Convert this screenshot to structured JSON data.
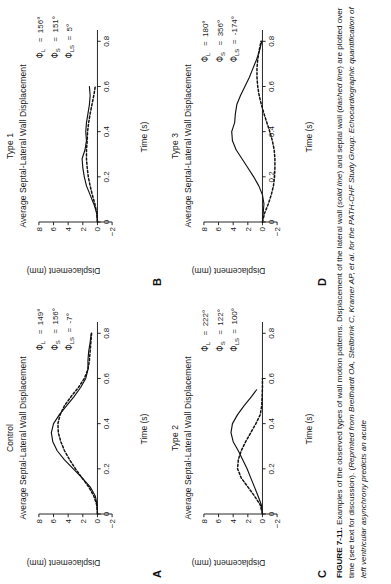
{
  "figure": {
    "number": "FIGURE 7-11.",
    "caption_plain": "FIGURE 7-11. Examples of the observed types of wall motion patterns. Displacement of the lateral wall (solid line) and septal wall (dashed line) are plotted over time (see text for discussion). (Reprinted from Breithardt OA, Stellbrink C, Kramer AP, et al. for the PATH-CHF Study Group: Echocardiographic quantification of left ventricular asynchrony predicts an acute",
    "caption_segments": [
      {
        "text": "FIGURE 7-11.",
        "style": "bold"
      },
      {
        "text": " Examples of the observed types of wall motion patterns. Displacement of the lateral wall (",
        "style": "normal"
      },
      {
        "text": "solid line",
        "style": "italic"
      },
      {
        "text": ") and septal wall (",
        "style": "normal"
      },
      {
        "text": "dashed line",
        "style": "italic"
      },
      {
        "text": ") are plotted over time (see text for discussion). (",
        "style": "normal"
      },
      {
        "text": "Reprinted from Breithardt OA, Stellbrink C, Kramer AP, et al. for the PATH-CHF Study Group: Echocardiographic quantification of left ventricular asynchrony predicts an acute",
        "style": "italic"
      }
    ]
  },
  "legend": {
    "solid_line": "lateral wall",
    "dashed_line": "septal wall"
  },
  "axes": {
    "xlabel": "Time (s)",
    "ylabel": "Displacement (mm)",
    "xticks": [
      "0",
      "0.2",
      "0.4",
      "0.6",
      "0.8"
    ],
    "yticks": [
      "8",
      "6",
      "4",
      "2",
      "0",
      "-2"
    ],
    "xlim": [
      0,
      0.85
    ],
    "ylim": [
      -2.6,
      8.6
    ]
  },
  "panels": [
    {
      "letter": "A",
      "group": "Control",
      "title": "Average Septal-Lateral Wall Displacement",
      "annotations": [
        {
          "symbol": "Φ",
          "sub": "L",
          "value": "149°"
        },
        {
          "symbol": "Φ",
          "sub": "S",
          "value": "156°"
        },
        {
          "symbol": "Φ",
          "sub": "LS",
          "value": "-7°"
        }
      ]
    },
    {
      "letter": "B",
      "group": "Type 1",
      "title": "Average Septal-Lateral Wall Displacement",
      "annotations": [
        {
          "symbol": "Φ",
          "sub": "L",
          "value": "156°"
        },
        {
          "symbol": "Φ",
          "sub": "S",
          "value": "151°"
        },
        {
          "symbol": "Φ",
          "sub": "LS",
          "value": "5°"
        }
      ]
    },
    {
      "letter": "C",
      "group": "Type 2",
      "title": "Average Septal-Lateral Wall Displacement",
      "annotations": [
        {
          "symbol": "Φ",
          "sub": "L",
          "value": "222°"
        },
        {
          "symbol": "Φ",
          "sub": "S",
          "value": "122°"
        },
        {
          "symbol": "Φ",
          "sub": "LS",
          "value": "100°"
        }
      ]
    },
    {
      "letter": "D",
      "group": "Type 3",
      "title": "Average Septal-Lateral Wall Displacement",
      "annotations": [
        {
          "symbol": "Φ",
          "sub": "L",
          "value": "180°"
        },
        {
          "symbol": "Φ",
          "sub": "S",
          "value": "356°"
        },
        {
          "symbol": "Φ",
          "sub": "LS",
          "value": "-174°"
        }
      ]
    }
  ],
  "chart_data": [
    {
      "type": "line",
      "panel": "A",
      "title": "Control",
      "subtitle": "Average Septal-Lateral Wall Displacement",
      "xlabel": "Time (s)",
      "ylabel": "Displacement (mm)",
      "xlim": [
        0,
        0.85
      ],
      "ylim": [
        -2.6,
        8.6
      ],
      "xticks": [
        0,
        0.2,
        0.4,
        0.6,
        0.8
      ],
      "yticks": [
        -2,
        0,
        2,
        4,
        6,
        8
      ],
      "grid": false,
      "legend": "none",
      "series": [
        {
          "name": "lateral wall (solid line)",
          "style": "solid",
          "x": [
            0,
            0.04,
            0.08,
            0.12,
            0.16,
            0.2,
            0.24,
            0.28,
            0.32,
            0.36,
            0.4,
            0.44,
            0.48,
            0.52,
            0.56,
            0.6,
            0.64,
            0.68,
            0.72,
            0.76,
            0.8
          ],
          "y": [
            0.0,
            0.05,
            0.3,
            1.0,
            2.1,
            3.3,
            4.5,
            5.5,
            6.1,
            6.3,
            6.0,
            5.2,
            4.2,
            3.2,
            2.3,
            1.6,
            1.3,
            1.3,
            1.2,
            1.0,
            0.85
          ]
        },
        {
          "name": "septal wall (dashed line)",
          "style": "dashed",
          "x": [
            0,
            0.04,
            0.08,
            0.12,
            0.16,
            0.2,
            0.24,
            0.28,
            0.32,
            0.36,
            0.4,
            0.44,
            0.48,
            0.52,
            0.56,
            0.6,
            0.64,
            0.68,
            0.72,
            0.76,
            0.8
          ],
          "y": [
            0.0,
            0.1,
            0.5,
            1.2,
            2.1,
            3.0,
            3.8,
            4.5,
            5.0,
            5.35,
            5.4,
            5.1,
            4.5,
            3.6,
            2.6,
            1.8,
            1.3,
            1.1,
            1.0,
            0.9,
            0.8
          ]
        }
      ]
    },
    {
      "type": "line",
      "panel": "B",
      "title": "Type 1",
      "subtitle": "Average Septal-Lateral Wall Displacement",
      "xlabel": "Time (s)",
      "ylabel": "Displacement (mm)",
      "xlim": [
        0,
        0.85
      ],
      "ylim": [
        -2.6,
        8.6
      ],
      "xticks": [
        0,
        0.2,
        0.4,
        0.6,
        0.8
      ],
      "yticks": [
        -2,
        0,
        2,
        4,
        6,
        8
      ],
      "grid": false,
      "legend": "none",
      "series": [
        {
          "name": "lateral wall (solid line)",
          "style": "solid",
          "x": [
            0,
            0.04,
            0.08,
            0.12,
            0.16,
            0.2,
            0.24,
            0.28,
            0.32,
            0.36,
            0.4,
            0.44,
            0.48,
            0.52,
            0.56,
            0.6
          ],
          "y": [
            0.0,
            0.1,
            0.5,
            1.0,
            1.5,
            1.8,
            2.0,
            2.1,
            1.7,
            1.5,
            1.6,
            1.5,
            1.3,
            1.1,
            1.0,
            1.1
          ]
        },
        {
          "name": "septal wall (dashed line)",
          "style": "dashed",
          "x": [
            0,
            0.04,
            0.08,
            0.12,
            0.16,
            0.2,
            0.24,
            0.28,
            0.32,
            0.36,
            0.4,
            0.44,
            0.48,
            0.52,
            0.56,
            0.6
          ],
          "y": [
            0.0,
            0.1,
            0.35,
            0.7,
            1.0,
            1.25,
            1.4,
            1.5,
            1.5,
            1.4,
            1.35,
            1.2,
            1.0,
            0.75,
            0.5,
            0.3
          ]
        }
      ]
    },
    {
      "type": "line",
      "panel": "C",
      "title": "Type 2",
      "subtitle": "Average Septal-Lateral Wall Displacement",
      "xlabel": "Time (s)",
      "ylabel": "Displacement (mm)",
      "xlim": [
        0,
        0.85
      ],
      "ylim": [
        -2.6,
        8.6
      ],
      "xticks": [
        0,
        0.2,
        0.4,
        0.6,
        0.8
      ],
      "yticks": [
        -2,
        0,
        2,
        4,
        6,
        8
      ],
      "grid": false,
      "legend": "none",
      "series": [
        {
          "name": "lateral wall (solid line)",
          "style": "solid",
          "x": [
            0,
            0.04,
            0.08,
            0.12,
            0.16,
            0.2,
            0.24,
            0.28,
            0.32,
            0.36,
            0.4,
            0.44,
            0.48,
            0.52,
            0.55
          ],
          "y": [
            0.0,
            0.15,
            0.6,
            1.1,
            1.6,
            2.1,
            2.7,
            3.3,
            4.0,
            4.3,
            4.1,
            3.4,
            2.5,
            1.5,
            0.8
          ]
        },
        {
          "name": "septal wall (dashed line)",
          "style": "dashed",
          "x": [
            0,
            0.04,
            0.08,
            0.12,
            0.16,
            0.2,
            0.24,
            0.28,
            0.32,
            0.36,
            0.4,
            0.44,
            0.48,
            0.52,
            0.56,
            0.6
          ],
          "y": [
            0.0,
            0.3,
            1.1,
            2.0,
            2.9,
            3.4,
            3.3,
            2.9,
            2.3,
            1.6,
            0.9,
            0.3,
            0.1,
            0.05,
            0.0,
            0.0
          ]
        }
      ]
    },
    {
      "type": "line",
      "panel": "D",
      "title": "Type 3",
      "subtitle": "Average Septal-Lateral Wall Displacement",
      "xlabel": "Time (s)",
      "ylabel": "Displacement (mm)",
      "xlim": [
        0,
        0.85
      ],
      "ylim": [
        -2.6,
        8.6
      ],
      "xticks": [
        0,
        0.2,
        0.4,
        0.6,
        0.8
      ],
      "yticks": [
        -2,
        0,
        2,
        4,
        6,
        8
      ],
      "grid": false,
      "legend": "none",
      "series": [
        {
          "name": "lateral wall (solid line)",
          "style": "solid",
          "x": [
            0,
            0.04,
            0.08,
            0.12,
            0.16,
            0.2,
            0.24,
            0.28,
            0.32,
            0.36,
            0.4,
            0.44,
            0.48,
            0.52,
            0.56,
            0.6,
            0.64,
            0.68,
            0.72,
            0.76,
            0.8
          ],
          "y": [
            0.0,
            -0.1,
            -0.2,
            0.0,
            0.5,
            1.2,
            2.0,
            2.8,
            3.6,
            4.1,
            4.2,
            3.8,
            3.7,
            3.5,
            3.0,
            2.4,
            1.8,
            1.3,
            0.8,
            0.4,
            0.1
          ]
        },
        {
          "name": "septal wall (dashed line)",
          "style": "dashed",
          "x": [
            0,
            0.04,
            0.08,
            0.12,
            0.16,
            0.2,
            0.24,
            0.28,
            0.32,
            0.36,
            0.4,
            0.44,
            0.48,
            0.52,
            0.56,
            0.6,
            0.64,
            0.68,
            0.72,
            0.76,
            0.8
          ],
          "y": [
            0.0,
            -0.3,
            -0.8,
            -1.2,
            -1.5,
            -1.65,
            -1.7,
            -1.7,
            -1.6,
            -1.35,
            -1.0,
            -0.6,
            -0.2,
            0.15,
            0.45,
            0.65,
            0.75,
            0.75,
            0.65,
            0.45,
            0.2
          ]
        }
      ]
    }
  ]
}
